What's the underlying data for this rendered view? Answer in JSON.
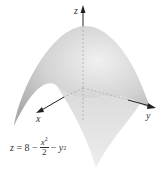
{
  "figure": {
    "surface_color": "#c9c9c9",
    "surface_highlight": "#ececec",
    "axis_color": "#222222",
    "axes": {
      "z_label": "z",
      "x_label": "x",
      "y_label": "y"
    },
    "equation": {
      "lhs": "z",
      "equals": "=",
      "constant": "8",
      "minus1": "−",
      "frac_num_var": "x",
      "frac_num_exp": "2",
      "frac_den": "2",
      "minus2": "−",
      "term2_var": "y",
      "term2_exp": "2"
    }
  }
}
